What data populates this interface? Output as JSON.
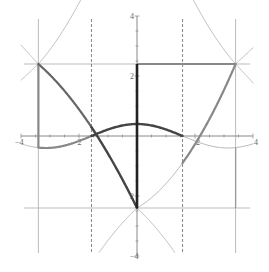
{
  "chart_data": {
    "type": "line",
    "title": "",
    "xlabel": "",
    "ylabel": "",
    "xlim": [
      -4,
      4
    ],
    "ylim": [
      -4,
      4
    ],
    "grid": false,
    "legend": null,
    "x_ticks": [
      {
        "value": -4,
        "label": "-4"
      },
      {
        "value": -2,
        "label": "-2"
      },
      {
        "value": 2,
        "label": "2"
      },
      {
        "value": 4,
        "label": "4"
      }
    ],
    "y_ticks": [
      {
        "value": 4,
        "label": "4"
      },
      {
        "value": 2,
        "label": "2"
      },
      {
        "value": -2,
        "label": "2"
      },
      {
        "value": -4,
        "label": "-4"
      }
    ],
    "reference_lines": {
      "horizontal": [
        2.4,
        -2.4
      ],
      "vertical_solid": [
        -3.4,
        3.4
      ],
      "vertical_dashed": [
        -1.5708,
        1.5708
      ]
    },
    "key_points": [
      {
        "x": -3.4,
        "y": 2.4
      },
      {
        "x": -1.5708,
        "y": 0
      },
      {
        "x": 0,
        "y": 0.4
      },
      {
        "x": 1.5708,
        "y": 0
      },
      {
        "x": 0,
        "y": -2.4
      },
      {
        "x": 3.4,
        "y": 2.4
      }
    ],
    "series": [
      {
        "name": "cosine-curve",
        "description": "y = 0.4 cos(x)",
        "x_range": [
          -4,
          4
        ],
        "amplitude": 0.4
      },
      {
        "name": "left-falling-arc",
        "from": [
          -3.4,
          2.4
        ],
        "via": [
          -1.5708,
          0
        ],
        "to": [
          0,
          -2.4
        ]
      },
      {
        "name": "right-rising-arc",
        "from": [
          0,
          -2.4
        ],
        "via": [
          1.5708,
          0
        ],
        "to": [
          3.4,
          2.4
        ]
      },
      {
        "name": "vertical-segment-x0",
        "from": [
          0,
          -2.4
        ],
        "to": [
          0,
          2.4
        ]
      },
      {
        "name": "horizontal-segment-top",
        "from": [
          0,
          2.4
        ],
        "to": [
          3.4,
          2.4
        ]
      },
      {
        "name": "vertical-segment-left",
        "from": [
          -3.4,
          2.4
        ],
        "to": [
          -3.4,
          -0.39
        ]
      }
    ]
  },
  "colors": {
    "axis": "#888888",
    "thin_curve": "#aaaaaa",
    "thick_gray": "#888888",
    "thick_dark": "#444444",
    "thick_black": "#222222",
    "dashed": "#666666"
  }
}
